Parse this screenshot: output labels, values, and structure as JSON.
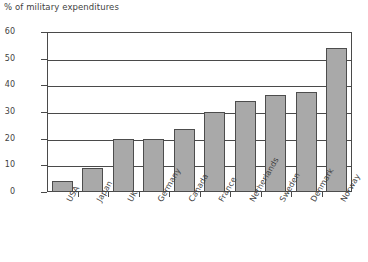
{
  "chart_data": {
    "type": "bar",
    "title": "% of military expenditures",
    "xlabel": "",
    "ylabel": "",
    "ylim": [
      0,
      60
    ],
    "yticks": [
      0,
      10,
      20,
      30,
      40,
      50,
      60
    ],
    "grid": true,
    "legend": false,
    "categories": [
      "USA",
      "Japan",
      "UK",
      "Germany",
      "Canada",
      "France",
      "Netherlands",
      "Sweden",
      "Denmark",
      "Norway"
    ],
    "values": [
      4,
      9,
      20,
      20,
      23.5,
      30,
      34,
      36.5,
      37.5,
      54
    ],
    "series": [
      {
        "name": "% of military expenditures",
        "values": [
          4,
          9,
          20,
          20,
          23.5,
          30,
          34,
          36.5,
          37.5,
          54
        ]
      }
    ],
    "colors": {
      "bar_fill": "#a9a9a9",
      "bar_border": "#4d4d4d",
      "axis": "#4a4a4a",
      "text": "#3f3f3f",
      "background": "#ffffff"
    }
  },
  "axis": {
    "y_tick_labels": [
      "0",
      "10",
      "20",
      "30",
      "40",
      "50",
      "60"
    ],
    "x_tick_labels": [
      "USA",
      "Japan",
      "UK",
      "Germany",
      "Canada",
      "France",
      "Netherlands",
      "Sweden",
      "Denmark",
      "Norway"
    ]
  }
}
